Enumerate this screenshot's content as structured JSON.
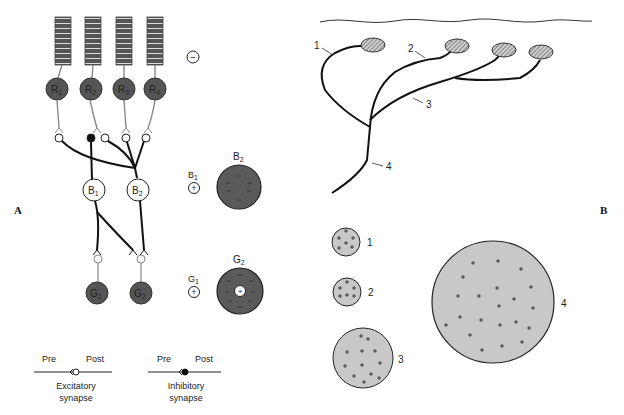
{
  "panels": {
    "A": {
      "label": "A",
      "photoreceptors": [
        {
          "id": "R1",
          "letter": "R",
          "sub": "1"
        },
        {
          "id": "R2",
          "letter": "R",
          "sub": "2"
        },
        {
          "id": "R3",
          "letter": "R",
          "sub": "3"
        },
        {
          "id": "R4",
          "letter": "R",
          "sub": "4"
        }
      ],
      "receptor_potential_sign": "−",
      "bipolar_cells": [
        {
          "id": "B1",
          "letter": "B",
          "sub": "1"
        },
        {
          "id": "B2",
          "letter": "B",
          "sub": "2"
        }
      ],
      "ganglion_cells": [
        {
          "id": "G1",
          "letter": "G",
          "sub": "1"
        },
        {
          "id": "G2",
          "letter": "G",
          "sub": "2"
        }
      ],
      "bipolar_fields": {
        "small_label": {
          "letter": "B",
          "sub": "1"
        },
        "small_sign": "+",
        "large_label": {
          "letter": "B",
          "sub": "2"
        },
        "large_signs": "−"
      },
      "ganglion_fields": {
        "small_label": {
          "letter": "G",
          "sub": "1"
        },
        "small_sign": "+",
        "large_label": {
          "letter": "G",
          "sub": "2"
        },
        "center_sign": "+",
        "surround_signs": "−"
      },
      "legend": {
        "excitatory": {
          "pre": "Pre",
          "post": "Post",
          "line1": "Excitatory",
          "line2": "synapse"
        },
        "inhibitory": {
          "pre": "Pre",
          "post": "Post",
          "line1": "Inhibitory",
          "line2": "synapse"
        }
      }
    },
    "B": {
      "label": "B",
      "branch_labels": [
        "1",
        "2",
        "3",
        "4"
      ],
      "field_labels": [
        "1",
        "2",
        "3",
        "4"
      ],
      "field_sign": "+"
    }
  },
  "colors": {
    "dark_cell": "#555555",
    "field_gray": "#c8c8c8",
    "line": "#111111",
    "gray_line": "#888888"
  }
}
